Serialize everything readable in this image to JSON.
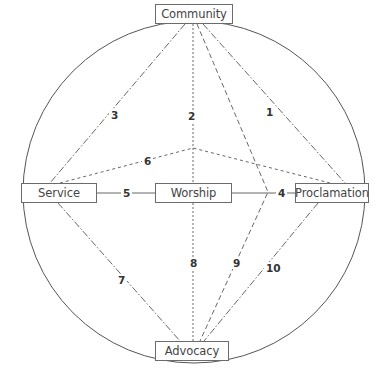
{
  "nodes": {
    "community": "Community",
    "service": "Service",
    "worship": "Worship",
    "proclamation": "Proclamation",
    "advocacy": "Advocacy"
  },
  "connections": [
    {
      "id": "1",
      "label": "1",
      "from": "Community",
      "to": "Proclamation",
      "style": "dash-dot"
    },
    {
      "id": "2",
      "label": "2",
      "from": "Community",
      "to": "Worship",
      "style": "dotted"
    },
    {
      "id": "3",
      "label": "3",
      "from": "Community",
      "to": "Service",
      "style": "dash-dot"
    },
    {
      "id": "4",
      "label": "4",
      "from": "Worship",
      "to": "Proclamation",
      "style": "solid"
    },
    {
      "id": "5",
      "label": "5",
      "from": "Service",
      "to": "Worship",
      "style": "solid"
    },
    {
      "id": "6",
      "label": "6",
      "from": "Service",
      "to": "Proclamation",
      "style": "dotted"
    },
    {
      "id": "7",
      "label": "7",
      "from": "Service",
      "to": "Advocacy",
      "style": "dash-dot"
    },
    {
      "id": "8",
      "label": "8",
      "from": "Worship",
      "to": "Advocacy",
      "style": "dotted"
    },
    {
      "id": "9",
      "label": "9",
      "from": "Community",
      "to": "Advocacy",
      "style": "dashed"
    },
    {
      "id": "10",
      "label": "10",
      "from": "Proclamation",
      "to": "Advocacy",
      "style": "dash-dot"
    }
  ],
  "colors": {
    "line": "#555555",
    "box_border": "#6b6b6b",
    "text": "#444444"
  }
}
